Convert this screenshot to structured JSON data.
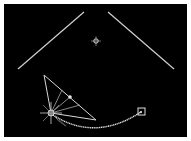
{
  "scene": {
    "background": "#000000",
    "border_color": "#ffffff",
    "line_color": "#d8d8d8",
    "left_wall": {
      "x1": 18,
      "y1": 69,
      "x2": 84,
      "y2": 12
    },
    "right_wall": {
      "x1": 108,
      "y1": 12,
      "x2": 174,
      "y2": 69
    },
    "target_crosshair": {
      "cx": 96,
      "cy": 41
    },
    "light_source": {
      "cx": 51,
      "cy": 113
    },
    "reflector_triangle": {
      "ax": 44,
      "ay": 75,
      "bx": 96,
      "by": 120
    },
    "handle_point": {
      "cx": 70,
      "cy": 97
    },
    "curve_end_square": {
      "x": 138,
      "y": 108,
      "size": 7
    }
  }
}
